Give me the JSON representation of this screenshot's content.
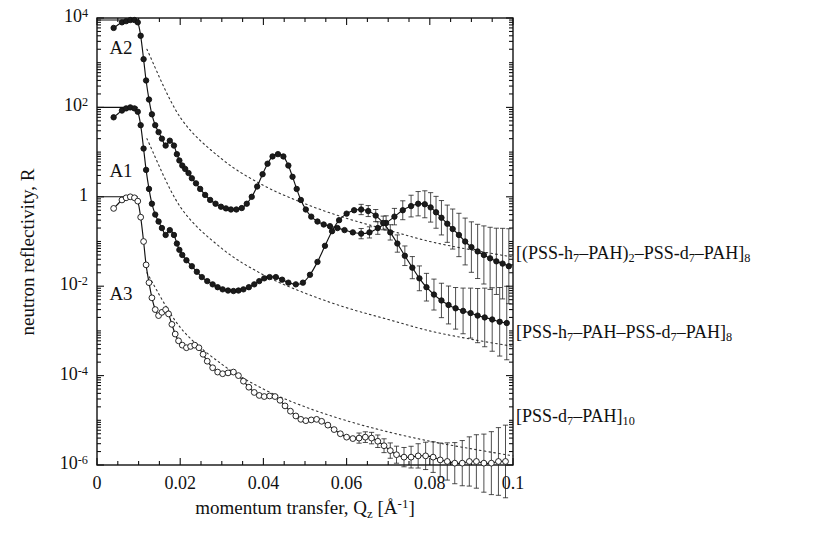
{
  "figure": {
    "kind": "neutron-reflectivity-plot",
    "background": "#ffffff",
    "ink": "#111111"
  },
  "axes": {
    "x": {
      "label_text": "momentum transfer, Q",
      "label_sub": "z",
      "label_unit": "[Å",
      "label_unit_sup": "-1",
      "label_unit_close": "]",
      "min": 0,
      "max": 0.1,
      "major_ticks": [
        0,
        0.02,
        0.04,
        0.06,
        0.08,
        0.1
      ],
      "major_tick_labels": [
        "0",
        "0.02",
        "0.04",
        "0.06",
        "0.08",
        "0.1"
      ],
      "minor_tick_step": 0.005,
      "scale": "linear"
    },
    "y": {
      "label": "neutron reflectivity, R",
      "min": 1e-06,
      "max": 10000.0,
      "scale": "log",
      "major_tick_exponents": [
        4,
        2,
        0,
        -2,
        -4,
        -6
      ],
      "major_tick_labels": [
        "10",
        "10",
        "1",
        "10",
        "10",
        "10"
      ],
      "major_tick_sups": [
        "4",
        "2",
        "",
        "-2",
        "-4",
        "-6"
      ]
    },
    "grid": false
  },
  "curve_tags": [
    {
      "name": "A2",
      "label": "A2",
      "x": 0.0025,
      "y_decade": 3.3
    },
    {
      "name": "A1",
      "label": "A1",
      "x": 0.0025,
      "y_decade": 0.55
    },
    {
      "name": "A3",
      "label": "A3",
      "x": 0.0025,
      "y_decade": -2.2
    }
  ],
  "legend": {
    "position": "right-outside",
    "entries": [
      {
        "curve": "A2",
        "y_px": 255,
        "parts": [
          {
            "t": "[(PSS-h"
          },
          {
            "t": "7",
            "sub": true
          },
          {
            "t": "–PAH)"
          },
          {
            "t": "2",
            "sub": true
          },
          {
            "t": "–PSS-d"
          },
          {
            "t": "7",
            "sub": true
          },
          {
            "t": "–PAH]"
          },
          {
            "t": "8",
            "sub": true
          }
        ],
        "plain": "[(PSS-h7–PAH)2–PSS-d7–PAH]8"
      },
      {
        "curve": "A1",
        "y_px": 334,
        "parts": [
          {
            "t": "[PSS-h"
          },
          {
            "t": "7",
            "sub": true
          },
          {
            "t": "–PAH–PSS-d"
          },
          {
            "t": "7",
            "sub": true
          },
          {
            "t": "–PAH]"
          },
          {
            "t": "8",
            "sub": true
          }
        ],
        "plain": "[PSS-h7–PAH–PSS-d7–PAH]8"
      },
      {
        "curve": "A3",
        "y_px": 418,
        "parts": [
          {
            "t": "[PSS-d"
          },
          {
            "t": "7",
            "sub": true
          },
          {
            "t": "–PAH]"
          },
          {
            "t": "10",
            "sub": true
          }
        ],
        "plain": "[PSS-d7–PAH]10"
      }
    ]
  },
  "chart_data": {
    "type": "line",
    "title": "",
    "xlabel": "momentum transfer, Qz [Å^-1]",
    "ylabel": "neutron reflectivity, R",
    "xlim": [
      0,
      0.1
    ],
    "ylim": [
      1e-06,
      10000.0
    ],
    "yscale": "log",
    "xscale": "linear",
    "grid": false,
    "legend_position": "right",
    "series": [
      {
        "name": "A2",
        "legend": "[(PSS-h7–PAH)2–PSS-d7–PAH]8",
        "marker": "filled-circle",
        "fit_line": "solid",
        "resolution_line": "dotted",
        "offset_decades": 4,
        "x": [
          0.004,
          0.006,
          0.007,
          0.008,
          0.009,
          0.0098,
          0.0105,
          0.0112,
          0.0118,
          0.0125,
          0.0132,
          0.014,
          0.0148,
          0.0156,
          0.0165,
          0.0175,
          0.0185,
          0.0192,
          0.0198,
          0.0205,
          0.0212,
          0.022,
          0.0228,
          0.0238,
          0.0248,
          0.026,
          0.0272,
          0.0285,
          0.0298,
          0.031,
          0.0322,
          0.0335,
          0.0348,
          0.036,
          0.0372,
          0.0385,
          0.0398,
          0.041,
          0.0422,
          0.0435,
          0.0448,
          0.046,
          0.047,
          0.048,
          0.049,
          0.0502,
          0.0515,
          0.053,
          0.0545,
          0.056,
          0.0578,
          0.0595,
          0.0615,
          0.0635,
          0.0655,
          0.0675,
          0.0695,
          0.0715,
          0.0735,
          0.0755,
          0.0772,
          0.0788,
          0.0802,
          0.0815,
          0.0828,
          0.0842,
          0.0855,
          0.087,
          0.0885,
          0.09,
          0.0915,
          0.093,
          0.0945,
          0.096,
          0.0975,
          0.099
        ],
        "y": [
          6000,
          8000,
          8500,
          9000,
          9000,
          8000,
          4000,
          1200,
          400,
          150,
          70,
          40,
          28,
          20,
          14,
          18,
          14,
          9,
          6.5,
          5,
          4.2,
          3.4,
          2.6,
          2.0,
          1.5,
          1.1,
          0.85,
          0.7,
          0.6,
          0.55,
          0.52,
          0.52,
          0.56,
          0.7,
          1.0,
          1.7,
          3.2,
          5.5,
          8.0,
          9.0,
          8.0,
          5.0,
          2.8,
          1.5,
          0.85,
          0.52,
          0.36,
          0.28,
          0.24,
          0.22,
          0.2,
          0.18,
          0.16,
          0.15,
          0.16,
          0.2,
          0.26,
          0.36,
          0.5,
          0.62,
          0.7,
          0.68,
          0.58,
          0.45,
          0.34,
          0.25,
          0.19,
          0.14,
          0.1,
          0.075,
          0.06,
          0.05,
          0.042,
          0.036,
          0.032,
          0.028
        ],
        "resolution_x": [
          0.012,
          0.02,
          0.03,
          0.04,
          0.05,
          0.06,
          0.07,
          0.08,
          0.09,
          0.1
        ],
        "resolution_y": [
          2000,
          60,
          7,
          1.8,
          0.7,
          0.33,
          0.18,
          0.1,
          0.065,
          0.045
        ],
        "notes": "Bragg peaks near Qz = 0.019 (weak), 0.042 (strong), 0.078 (strong)"
      },
      {
        "name": "A1",
        "legend": "[PSS-h7–PAH–PSS-d7–PAH]8",
        "marker": "filled-circle",
        "fit_line": "solid",
        "resolution_line": "dotted",
        "offset_decades": 2,
        "x": [
          0.004,
          0.006,
          0.007,
          0.008,
          0.009,
          0.0098,
          0.0105,
          0.0112,
          0.0118,
          0.0125,
          0.0132,
          0.014,
          0.0148,
          0.0156,
          0.0165,
          0.0175,
          0.0185,
          0.0192,
          0.0198,
          0.0205,
          0.0215,
          0.0228,
          0.024,
          0.0252,
          0.0265,
          0.0278,
          0.029,
          0.0302,
          0.0315,
          0.0328,
          0.034,
          0.0352,
          0.0365,
          0.0378,
          0.039,
          0.0402,
          0.0415,
          0.043,
          0.0445,
          0.046,
          0.0478,
          0.0495,
          0.0512,
          0.053,
          0.0548,
          0.0565,
          0.0582,
          0.06,
          0.0618,
          0.0635,
          0.0652,
          0.067,
          0.0688,
          0.0705,
          0.0722,
          0.074,
          0.0758,
          0.0775,
          0.0792,
          0.081,
          0.0828,
          0.0845,
          0.0862,
          0.088,
          0.0898,
          0.0915,
          0.0932,
          0.095,
          0.0968,
          0.0985
        ],
        "y": [
          60,
          85,
          95,
          100,
          95,
          80,
          40,
          12,
          4,
          1.5,
          0.7,
          0.4,
          0.28,
          0.2,
          0.14,
          0.18,
          0.14,
          0.09,
          0.065,
          0.05,
          0.038,
          0.028,
          0.021,
          0.016,
          0.013,
          0.011,
          0.0095,
          0.0085,
          0.008,
          0.0078,
          0.008,
          0.0085,
          0.0095,
          0.011,
          0.013,
          0.015,
          0.016,
          0.016,
          0.014,
          0.012,
          0.011,
          0.012,
          0.018,
          0.035,
          0.08,
          0.17,
          0.3,
          0.42,
          0.5,
          0.52,
          0.48,
          0.38,
          0.26,
          0.16,
          0.09,
          0.048,
          0.026,
          0.015,
          0.0095,
          0.0065,
          0.0048,
          0.0038,
          0.0032,
          0.0028,
          0.0025,
          0.0022,
          0.002,
          0.0018,
          0.0016,
          0.0015
        ],
        "resolution_x": [
          0.012,
          0.02,
          0.03,
          0.04,
          0.05,
          0.06,
          0.07,
          0.08,
          0.09,
          0.1
        ],
        "resolution_y": [
          20,
          0.6,
          0.07,
          0.018,
          0.007,
          0.0033,
          0.0018,
          0.001,
          0.00065,
          0.00045
        ],
        "notes": "Single strong Bragg peak near Qz = 0.062"
      },
      {
        "name": "A3",
        "legend": "[PSS-d7–PAH]10",
        "marker": "open-circle",
        "fit_line": "solid",
        "resolution_line": "dotted",
        "offset_decades": 0,
        "x": [
          0.004,
          0.006,
          0.007,
          0.008,
          0.009,
          0.0098,
          0.0105,
          0.0112,
          0.0118,
          0.0125,
          0.0132,
          0.014,
          0.0148,
          0.0156,
          0.0165,
          0.0172,
          0.018,
          0.0188,
          0.0196,
          0.0205,
          0.0215,
          0.0225,
          0.0235,
          0.0245,
          0.0255,
          0.0265,
          0.0278,
          0.029,
          0.0302,
          0.0315,
          0.0328,
          0.034,
          0.0352,
          0.0365,
          0.0378,
          0.039,
          0.0402,
          0.0415,
          0.0428,
          0.044,
          0.0452,
          0.0465,
          0.0478,
          0.049,
          0.0502,
          0.0515,
          0.0528,
          0.054,
          0.0555,
          0.057,
          0.0585,
          0.06,
          0.0615,
          0.063,
          0.0645,
          0.066,
          0.0675,
          0.069,
          0.0705,
          0.072,
          0.0738,
          0.0755,
          0.0772,
          0.079,
          0.0808,
          0.0825,
          0.0842,
          0.086,
          0.0878,
          0.0895,
          0.0912,
          0.093,
          0.0948,
          0.0965,
          0.0982
        ],
        "y": [
          0.55,
          0.85,
          0.95,
          1.0,
          0.95,
          0.8,
          0.35,
          0.1,
          0.03,
          0.012,
          0.0055,
          0.003,
          0.0022,
          0.0026,
          0.003,
          0.0024,
          0.0014,
          0.00085,
          0.0006,
          0.00048,
          0.00042,
          0.00045,
          0.00048,
          0.00042,
          0.0003,
          0.00021,
          0.00015,
          0.00012,
          0.00011,
          0.000115,
          0.00012,
          0.0001,
          7.5e-05,
          5.5e-05,
          4.2e-05,
          3.6e-05,
          3.4e-05,
          3.5e-05,
          3.4e-05,
          2.8e-05,
          2.1e-05,
          1.6e-05,
          1.25e-05,
          1.05e-05,
          9.8e-06,
          1.02e-05,
          1.05e-05,
          9.5e-06,
          7.8e-06,
          6.2e-06,
          5e-06,
          4.2e-06,
          3.9e-06,
          4e-06,
          4.2e-06,
          4e-06,
          3.4e-06,
          2.7e-06,
          2.1e-06,
          1.7e-06,
          1.5e-06,
          1.5e-06,
          1.6e-06,
          1.6e-06,
          1.5e-06,
          1.3e-06,
          1.2e-06,
          1.1e-06,
          1.1e-06,
          1.2e-06,
          1.2e-06,
          1.1e-06,
          1.1e-06,
          1.2e-06,
          1.2e-06
        ],
        "resolution_x": [
          0.012,
          0.02,
          0.03,
          0.04,
          0.05,
          0.06,
          0.07,
          0.08,
          0.09,
          0.1
        ],
        "resolution_y": [
          0.02,
          0.0012,
          0.00018,
          5e-05,
          2e-05,
          9.8e-06,
          5.5e-06,
          3.4e-06,
          2.3e-06,
          1.6e-06
        ],
        "notes": "Kiessig fringes only; no Bragg peaks; error bars grow beyond Qz = 0.065"
      }
    ]
  }
}
